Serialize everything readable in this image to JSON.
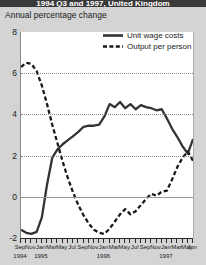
{
  "header": {
    "title": "1994 Q3 and 1997, United Kingdom"
  },
  "subtitle": "Annual percentage change",
  "legend": [
    {
      "label": "Unit wage costs",
      "style": "solid",
      "color": "#333333"
    },
    {
      "label": "Output per person",
      "style": "dashed",
      "color": "#1a1a1a"
    }
  ],
  "axis": {
    "y_ticks": [
      "8",
      "6",
      "4",
      "2",
      "0",
      "-2"
    ],
    "x_month_labels": [
      "Sep",
      "Nov",
      "Jan",
      "Mar",
      "May",
      "Jul",
      "Sep",
      "Nov",
      "Jan",
      "Mar",
      "May",
      "Jul",
      "Sep",
      "Nov",
      "Jan",
      "Mar",
      "May",
      "Jun"
    ],
    "x_year_labels": [
      "1994",
      "1995",
      "1996",
      "1997"
    ]
  },
  "chart_data": {
    "type": "line",
    "title": "1994 Q3 and 1997, United Kingdom",
    "subtitle": "Annual percentage change",
    "xlabel": "",
    "ylabel": "Annual percentage change",
    "ylim": [
      -2,
      8
    ],
    "yticks": [
      -2,
      0,
      2,
      4,
      6,
      8
    ],
    "grid": true,
    "legend_position": "top-right",
    "x": [
      "Sep 1994",
      "Oct 1994",
      "Nov 1994",
      "Dec 1994",
      "Jan 1995",
      "Feb 1995",
      "Mar 1995",
      "Apr 1995",
      "May 1995",
      "Jun 1995",
      "Jul 1995",
      "Aug 1995",
      "Sep 1995",
      "Oct 1995",
      "Nov 1995",
      "Dec 1995",
      "Jan 1996",
      "Feb 1996",
      "Mar 1996",
      "Apr 1996",
      "May 1996",
      "Jun 1996",
      "Jul 1996",
      "Aug 1996",
      "Sep 1996",
      "Oct 1996",
      "Nov 1996",
      "Dec 1996",
      "Jan 1997",
      "Feb 1997",
      "Mar 1997",
      "Apr 1997",
      "May 1997",
      "Jun 1997"
    ],
    "series": [
      {
        "name": "Unit wage costs",
        "style": "solid",
        "color": "#333333",
        "values": [
          -1.6,
          -1.75,
          -1.8,
          -1.7,
          -1.0,
          0.6,
          1.9,
          2.3,
          2.55,
          2.75,
          2.95,
          3.15,
          3.4,
          3.45,
          3.45,
          3.5,
          3.9,
          4.5,
          4.35,
          4.6,
          4.3,
          4.5,
          4.25,
          4.45,
          4.35,
          4.3,
          4.2,
          4.25,
          3.8,
          3.3,
          2.9,
          2.45,
          2.1,
          2.8
        ]
      },
      {
        "name": "Output per person",
        "style": "dashed",
        "color": "#1a1a1a",
        "values": [
          6.3,
          6.5,
          6.45,
          6.1,
          5.4,
          4.5,
          3.5,
          2.6,
          1.7,
          0.9,
          0.2,
          -0.4,
          -0.9,
          -1.3,
          -1.6,
          -1.75,
          -1.8,
          -1.55,
          -1.2,
          -0.85,
          -0.6,
          -0.85,
          -0.7,
          -0.4,
          -0.1,
          0.15,
          0.05,
          0.25,
          0.3,
          0.85,
          1.45,
          1.9,
          2.2,
          1.75
        ]
      }
    ]
  }
}
